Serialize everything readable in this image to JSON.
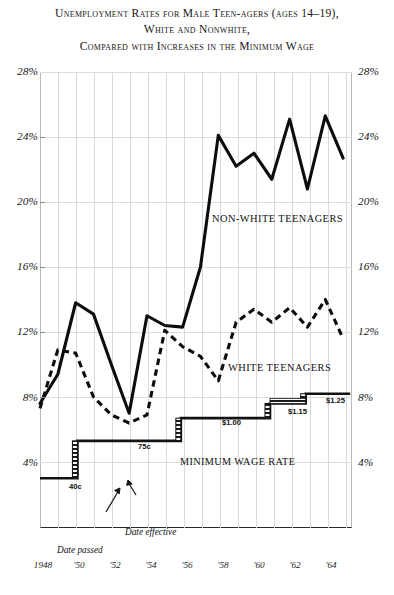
{
  "title": {
    "line1": "Unemployment Rates for Male Teen-agers (ages 14–19),",
    "line2": "White and Nonwhite,",
    "line3": "Compared with Increases in the Minimum Wage"
  },
  "axes": {
    "y_ticks": [
      "28%",
      "24%",
      "20%",
      "16%",
      "12%",
      "8%",
      "4%"
    ],
    "x_ticks": [
      "1948",
      "'50",
      "'52",
      "'54",
      "'56",
      "'58",
      "'60",
      "'62",
      "'64"
    ]
  },
  "annotations": {
    "nonwhite_label": "NON-WHITE TEENAGERS",
    "white_label": "WHITE TEENAGERS",
    "wage_label": "MINIMUM WAGE RATE",
    "wage_40c": "40c",
    "wage_75c": "75c",
    "wage_100": "$1.00",
    "wage_115": "$1.15",
    "wage_125": "$1.25",
    "date_effective": "Date effective",
    "date_passed": "Date passed"
  },
  "chart_data": {
    "type": "line",
    "title": "Unemployment Rates for Male Teen-agers (ages 14–19), White and Nonwhite, Compared with Increases in the Minimum Wage",
    "xlabel": "",
    "ylabel": "Unemployment rate (%)",
    "ylim": [
      0,
      28
    ],
    "xlim": [
      1948,
      1965.5
    ],
    "grid": true,
    "legend": "inline-annotations",
    "x": [
      1948,
      1949,
      1950,
      1951,
      1952,
      1953,
      1954,
      1955,
      1956,
      1957,
      1958,
      1959,
      1960,
      1961,
      1962,
      1963,
      1964,
      1965
    ],
    "series": [
      {
        "name": "NON-WHITE TEENAGERS",
        "style": "solid",
        "values": [
          7.6,
          9.4,
          13.8,
          13.1,
          10.0,
          7.0,
          13.0,
          12.4,
          12.3,
          16.0,
          24.1,
          22.2,
          23.0,
          21.4,
          25.1,
          20.8,
          25.3,
          22.7
        ]
      },
      {
        "name": "WHITE TEENAGERS",
        "style": "dashed",
        "values": [
          7.3,
          10.9,
          10.7,
          8.0,
          6.9,
          6.4,
          6.9,
          12.1,
          11.1,
          10.5,
          9.0,
          12.6,
          13.4,
          12.6,
          13.5,
          12.3,
          14.0,
          11.6
        ]
      }
    ],
    "step_series": {
      "name": "MINIMUM WAGE RATE",
      "note": "Plotted on same vertical scale; step heights correspond to the % axis positions shown.",
      "steps": [
        {
          "label": "40c",
          "value": 0.4,
          "start_year": 1948,
          "end_year": 1950.1,
          "plot_level_pct": 3.0
        },
        {
          "label": "75c",
          "value": 0.75,
          "start_year": 1950.1,
          "end_year": 1955.9,
          "plot_level_pct": 5.3
        },
        {
          "label": "$1.00",
          "value": 1.0,
          "start_year": 1955.9,
          "end_year": 1960.9,
          "plot_level_pct": 6.7
        },
        {
          "label": "$1.15",
          "value": 1.15,
          "start_year": 1960.9,
          "end_year": 1962.9,
          "plot_level_pct": 7.6
        },
        {
          "label": "$1.25",
          "value": 1.25,
          "start_year": 1962.9,
          "end_year": 1965.4,
          "plot_level_pct": 8.2
        }
      ],
      "hatched_risers": "Hatched vertical bars mark the interval between the date a minimum-wage increase was passed and the date it became effective."
    }
  }
}
